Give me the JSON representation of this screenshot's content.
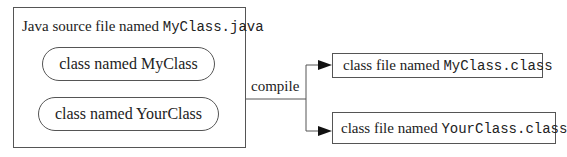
{
  "source_file": {
    "title_prefix": "Java source file named ",
    "title_file": "MyClass.java",
    "classes": [
      {
        "label": "class named MyClass"
      },
      {
        "label": "class named YourClass"
      }
    ]
  },
  "edge": {
    "label": "compile"
  },
  "outputs": [
    {
      "prefix": "class file named ",
      "file": "MyClass.class"
    },
    {
      "prefix": "class file named ",
      "file": "YourClass.class"
    }
  ]
}
